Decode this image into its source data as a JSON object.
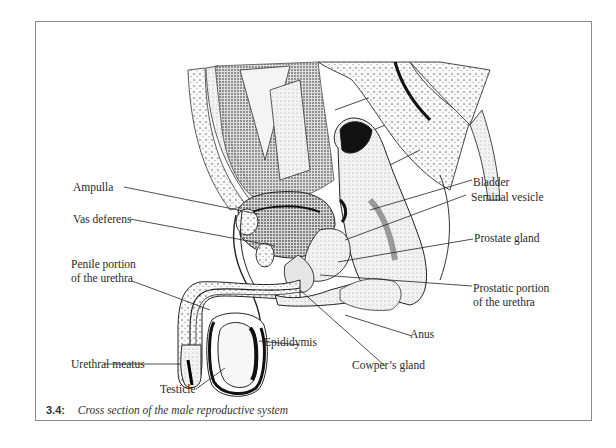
{
  "figure": {
    "number": "3.4:",
    "caption": "Cross section of the male reproductive system"
  },
  "labels": {
    "bladder": "Bladder",
    "ampulla": "Ampulla",
    "seminal_vesicle": "Seminal vesicle",
    "vas_deferens": "Vas deferens",
    "prostate_gland": "Prostate gland",
    "penile_urethra_line1": "Penile portion",
    "penile_urethra_line2": "of the urethra",
    "prostatic_urethra_line1": "Prostatic portion",
    "prostatic_urethra_line2": "of the urethra",
    "anus": "Anus",
    "epididymis": "Epididymis",
    "urethral_meatus": "Urethral meatus",
    "cowpers_gland": "Cowper’s gland",
    "testicle": "Testicle"
  },
  "colors": {
    "ink": "#1a1a1a",
    "frame": "#8a8a8a",
    "background": "#ffffff"
  }
}
